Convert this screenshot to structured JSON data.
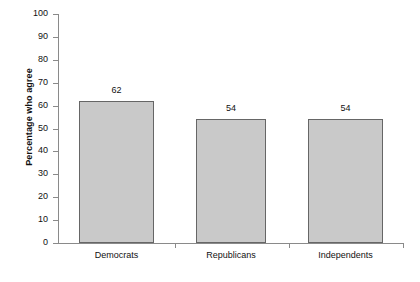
{
  "chart_data": {
    "type": "bar",
    "title": "",
    "subtitle": "",
    "xlabel": "",
    "ylabel": "Percentage who agree",
    "categories": [
      "Democrats",
      "Republicans",
      "Independents"
    ],
    "values": [
      62,
      54,
      54
    ],
    "value_labels": [
      "62",
      "54",
      "54"
    ],
    "ylim": [
      0,
      100
    ],
    "ytick_step": 10,
    "ytick_labels": [
      "0",
      "10",
      "20",
      "30",
      "40",
      "50",
      "60",
      "70",
      "80",
      "90",
      "100"
    ],
    "ytick_values": [
      0,
      10,
      20,
      30,
      40,
      50,
      60,
      70,
      80,
      90,
      100
    ],
    "grid": false,
    "legend": null,
    "legend_position": "none",
    "colors": {
      "bar_fill": "#c9c9c9",
      "bar_border": "#666666",
      "axis": "#8a8a8a",
      "text": "#111111",
      "background": "#ffffff"
    }
  }
}
